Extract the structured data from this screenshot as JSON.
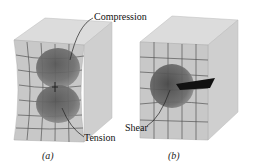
{
  "labels": {
    "compression": "Compression",
    "tension": "Tension",
    "shear": "Shear"
  },
  "captions": {
    "a": "(a)",
    "b": "(b)"
  }
}
